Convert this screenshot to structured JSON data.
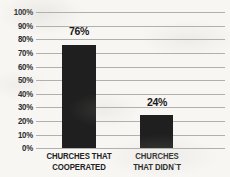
{
  "chart_data": {
    "type": "bar",
    "title": "",
    "xlabel": "",
    "ylabel": "",
    "categories": [
      "CHURCHES THAT COOPERATED",
      "CHURCHES THAT DIDN`T"
    ],
    "category_lines": [
      [
        "CHURCHES THAT",
        "COOPERATED"
      ],
      [
        "CHURCHES",
        "THAT DIDN`T"
      ]
    ],
    "values": [
      76,
      24
    ],
    "value_labels": [
      "76%",
      "24%"
    ],
    "ylim": [
      0,
      100
    ],
    "ytick_values": [
      100,
      90,
      80,
      70,
      60,
      50,
      40,
      30,
      20,
      10,
      0
    ],
    "ytick_labels": [
      "100%",
      "90%",
      "80%",
      "70%",
      "60%",
      "50%",
      "40%",
      "30%",
      "20%",
      "10%",
      "0%"
    ],
    "grid": true,
    "legend": "none",
    "bar_color": "#1f1f1f",
    "grid_color": "#b0b0ae",
    "background_color": "#f7f6f3",
    "text_color": "#232323"
  }
}
